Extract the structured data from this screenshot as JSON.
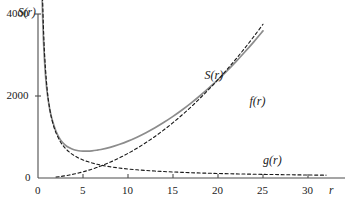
{
  "chart_data": {
    "type": "line",
    "title": "",
    "subtitle": "",
    "xlabel": "r",
    "ylabel": "S(r)",
    "xlim": [
      0,
      32.5
    ],
    "ylim": [
      0,
      4400
    ],
    "grid": false,
    "legend_position": "inline-annotations",
    "xticks": [
      0,
      5,
      10,
      15,
      20,
      25,
      30
    ],
    "xtick_labels": [
      "0",
      "5",
      "10",
      "15",
      "20",
      "25",
      "30"
    ],
    "yticks": [
      0,
      2000,
      4000
    ],
    "ytick_labels": [
      "0",
      "2000",
      "4000"
    ],
    "annotations": [
      {
        "text": "S(r)",
        "x": 18.5,
        "y": 2500
      },
      {
        "text": "f(r)",
        "x": 23.5,
        "y": 1850
      },
      {
        "text": "g(r)",
        "x": 25.0,
        "y": 420
      }
    ],
    "series": [
      {
        "name": "S(r)",
        "style": "solid",
        "color": "#8c8c8c",
        "x": [
          0.45,
          0.6,
          0.8,
          1.0,
          1.3,
          1.6,
          2.0,
          2.5,
          3.0,
          3.5,
          4.0,
          4.5,
          5.0,
          5.5,
          6.0,
          6.5,
          7.0,
          8.0,
          9.0,
          10.0,
          11.0,
          12.0,
          13.0,
          14.0,
          15.0,
          16.0,
          17.0,
          18.0,
          19.0,
          20.0,
          21.0,
          22.0,
          23.0,
          24.0,
          25.0
        ],
        "y": [
          4450,
          3400,
          2600,
          2120,
          1680,
          1400,
          1140,
          930,
          810,
          735,
          690,
          665,
          655,
          655,
          662,
          676,
          695,
          748,
          818,
          900,
          996,
          1105,
          1225,
          1358,
          1502,
          1658,
          1826,
          2006,
          2197,
          2400,
          2614,
          2840,
          3078,
          3327,
          3588
        ]
      },
      {
        "name": "f(r)",
        "style": "dashed",
        "color": "#1a1a1a",
        "x": [
          2.0,
          2.5,
          3.0,
          3.5,
          4.0,
          4.5,
          5.0,
          5.5,
          6.0,
          6.5,
          7.0,
          8.0,
          9.0,
          10.0,
          11.0,
          12.0,
          13.0,
          14.0,
          15.0,
          16.0,
          17.0,
          18.0,
          19.0,
          20.0,
          21.0,
          22.0,
          23.0,
          24.0,
          25.0
        ],
        "y": [
          24,
          37,
          54,
          73,
          96,
          122,
          150,
          182,
          216,
          254,
          294,
          384,
          486,
          600,
          726,
          864,
          1014,
          1176,
          1350,
          1536,
          1734,
          1944,
          2166,
          2400,
          2646,
          2904,
          3174,
          3456,
          3750
        ]
      },
      {
        "name": "g(r)",
        "style": "dashed",
        "color": "#1a1a1a",
        "x": [
          0.5,
          0.7,
          1.0,
          1.3,
          1.6,
          2.0,
          2.5,
          3.0,
          3.5,
          4.0,
          4.5,
          5.0,
          5.5,
          6.0,
          6.5,
          7.0,
          8.0,
          9.0,
          10.0,
          11.0,
          12.0,
          13.0,
          14.0,
          15.0,
          16.0,
          17.0,
          18.0,
          19.0,
          20.0,
          22.0,
          24.0,
          26.0,
          28.0,
          30.0,
          32.0
        ],
        "y": [
          4400,
          3150,
          2200,
          1690,
          1375,
          1100,
          880,
          733,
          629,
          550,
          489,
          440,
          400,
          367,
          338,
          314,
          275,
          244,
          220,
          200,
          183,
          169,
          157,
          147,
          138,
          129,
          122,
          116,
          110,
          100,
          92,
          85,
          79,
          73,
          69
        ]
      }
    ]
  },
  "axis": {
    "y_name": "S(r)",
    "x_name": "r",
    "origin_label": "0"
  }
}
